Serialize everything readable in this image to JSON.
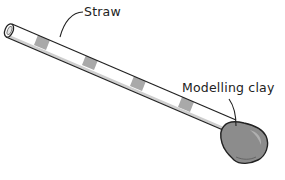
{
  "diagram": {
    "labels": {
      "straw": "Straw",
      "clay": "Modelling clay"
    },
    "colors": {
      "outline": "#222222",
      "stripe": "#9a9a9a",
      "straw_fill": "#ffffff",
      "clay_fill": "#8c8c8c",
      "clay_highlight": "#b4b4b4"
    }
  }
}
